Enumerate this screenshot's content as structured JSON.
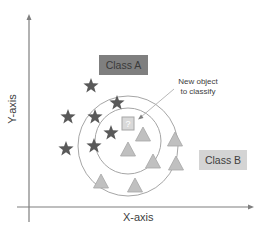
{
  "diagram": {
    "type": "knn-classification",
    "axes": {
      "x_label": "X-axis",
      "y_label": "Y-axis"
    },
    "classes": [
      {
        "name": "Class A",
        "marker": "star",
        "color": "#595959",
        "box_color": "#7f7f7f",
        "box_text_color": "#404040"
      },
      {
        "name": "Class B",
        "marker": "triangle",
        "color": "#c0c0c0",
        "box_color": "#d4d4d4",
        "box_text_color": "#404040"
      }
    ],
    "new_object": {
      "marker": "square",
      "symbol": "?",
      "annotation_line1": "New object",
      "annotation_line2": "to classify"
    },
    "points": {
      "class_a": [
        [
          91,
          86
        ],
        [
          68,
          117
        ],
        [
          95,
          117
        ],
        [
          117,
          103
        ],
        [
          66,
          149
        ],
        [
          94,
          146
        ],
        [
          111,
          133
        ]
      ],
      "class_b": [
        [
          143,
          135
        ],
        [
          128,
          150
        ],
        [
          175,
          140
        ],
        [
          153,
          162
        ],
        [
          176,
          164
        ],
        [
          101,
          182
        ],
        [
          135,
          186
        ]
      ],
      "new": [
        128,
        124
      ]
    },
    "circles": [
      {
        "name": "inner-k-radius",
        "cx": 128,
        "cy": 141,
        "r": 33
      },
      {
        "name": "outer-k-radius",
        "cx": 128,
        "cy": 146,
        "r": 50
      }
    ]
  }
}
